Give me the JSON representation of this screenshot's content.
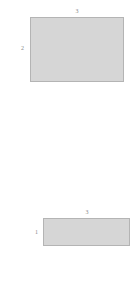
{
  "figure": {
    "background_color": "#ffffff",
    "shape_fill_color": "#d6d6d6",
    "shape_border_color": "#b4b4b4",
    "label_color": "#8a8a8a",
    "shapes": [
      {
        "name": "top-rectangle",
        "width_label": "3",
        "height_label": "2"
      },
      {
        "name": "bottom-rectangle",
        "width_label": "3",
        "height_label": "1"
      }
    ]
  },
  "chart_data": {
    "type": "diagram",
    "title": "",
    "items": [
      {
        "id": "top-rectangle",
        "width": 3,
        "height": 2,
        "width_label": "3",
        "height_label": "2",
        "fill": "#d6d6d6",
        "stroke": "#b4b4b4"
      },
      {
        "id": "bottom-rectangle",
        "width": 3,
        "height": 1,
        "width_label": "3",
        "height_label": "1",
        "fill": "#d6d6d6",
        "stroke": "#b4b4b4"
      }
    ]
  }
}
